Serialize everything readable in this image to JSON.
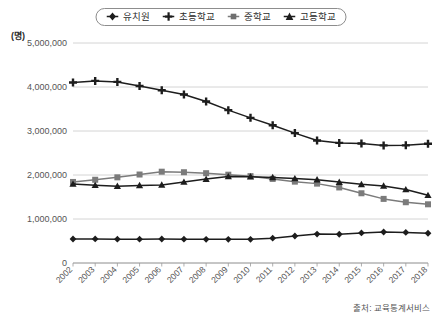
{
  "unit_label": "(명)",
  "source_note": "출처: 교육통계서비스",
  "legend": {
    "items": [
      {
        "label": "유치원",
        "marker": "diamond",
        "color": "#1d1d1d",
        "icon": "diamond-marker-icon"
      },
      {
        "label": "초등학교",
        "marker": "plus",
        "color": "#1d1d1d",
        "icon": "plus-marker-icon"
      },
      {
        "label": "중학교",
        "marker": "square",
        "color": "#7b7b7b",
        "icon": "square-marker-icon"
      },
      {
        "label": "고등학교",
        "marker": "triangle",
        "color": "#1d1d1d",
        "icon": "triangle-marker-icon"
      }
    ]
  },
  "chart_data": {
    "type": "line",
    "title": "",
    "xlabel": "",
    "ylabel": "(명)",
    "ylim": [
      0,
      5000000
    ],
    "ytick_values": [
      0,
      1000000,
      2000000,
      3000000,
      4000000,
      5000000
    ],
    "ytick_labels": [
      "0",
      "1,000,000",
      "2,000,000",
      "3,000,000",
      "4,000,000",
      "5,000,000"
    ],
    "grid": true,
    "legend_position": "top-center",
    "categories": [
      "2002",
      "2003",
      "2004",
      "2005",
      "2006",
      "2007",
      "2008",
      "2009",
      "2010",
      "2011",
      "2012",
      "2013",
      "2014",
      "2015",
      "2016",
      "2017",
      "2018"
    ],
    "series": [
      {
        "name": "유치원",
        "marker": "diamond",
        "color": "#1d1d1d",
        "values": [
          545000,
          547000,
          542000,
          541000,
          545000,
          541000,
          537000,
          538000,
          538000,
          564000,
          614000,
          658000,
          653000,
          683000,
          704000,
          695000,
          676000
        ]
      },
      {
        "name": "초등학교",
        "marker": "plus",
        "color": "#1d1d1d",
        "values": [
          4103000,
          4139000,
          4116000,
          4023000,
          3925000,
          3830000,
          3672000,
          3474000,
          3299000,
          3132000,
          2952000,
          2784000,
          2729000,
          2715000,
          2673000,
          2674000,
          2711000
        ]
      },
      {
        "name": "중학교",
        "marker": "square",
        "color": "#7b7b7b",
        "values": [
          1842000,
          1892000,
          1947000,
          2011000,
          2075000,
          2063000,
          2041000,
          2007000,
          1974000,
          1911000,
          1849000,
          1804000,
          1717000,
          1585000,
          1457000,
          1381000,
          1334000
        ]
      },
      {
        "name": "고등학교",
        "marker": "triangle",
        "color": "#1d1d1d",
        "values": [
          1796000,
          1766000,
          1746000,
          1762000,
          1775000,
          1841000,
          1907000,
          1966000,
          1962000,
          1944000,
          1920000,
          1893000,
          1839000,
          1788000,
          1752000,
          1670000,
          1539000
        ]
      }
    ]
  }
}
